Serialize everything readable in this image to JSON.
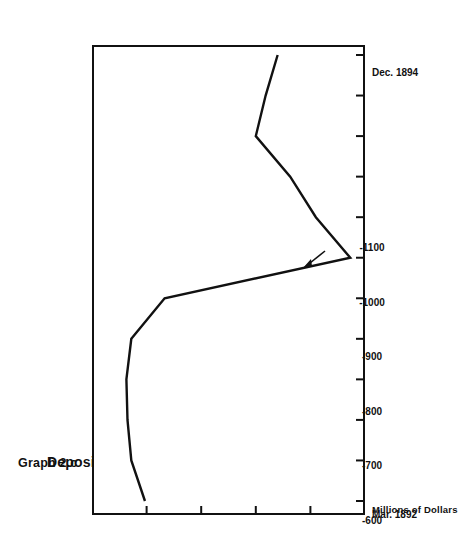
{
  "figure": {
    "graph_label": "Graph 2.c",
    "title": "Deposits Held by Individuals II: 1892-1894",
    "value_axis_title": "Millions of Dollars",
    "orientation": "rotated-90-ccw",
    "ink_color": "#111111",
    "background_color": "#ffffff"
  },
  "annotation": {
    "arrow_name": "peak-arrow",
    "description": "arrow pointing to local maximum"
  },
  "chart_data": {
    "type": "line",
    "title": "Deposits Held by Individuals II: 1892-1894",
    "subtitle": "Graph 2.c",
    "xlabel": "",
    "ylabel": "Millions of Dollars",
    "grid": false,
    "legend": null,
    "x_tick_labels": [
      "Mar. 1892",
      "Dec. 1894"
    ],
    "x_tick_count": 12,
    "y_tick_labels": [
      "-600",
      "-700",
      "-800",
      "-900",
      "-1000",
      "-1100"
    ],
    "y_values_ticks": [
      -600,
      -700,
      -800,
      -900,
      -1000,
      -1100
    ],
    "ylim": [
      -1100,
      -600
    ],
    "xlim": [
      "Mar. 1892",
      "Dec. 1894"
    ],
    "x": [
      "Mar. 1892",
      "Jun. 1892",
      "Sep. 1892",
      "Dec. 1892",
      "Mar. 1893",
      "Jun. 1893",
      "Sep. 1893",
      "Dec. 1893",
      "Mar. 1894",
      "Jun. 1894",
      "Sep. 1894",
      "Dec. 1894"
    ],
    "series": [
      {
        "name": "Deposits Held by Individuals II",
        "values": [
          -697,
          -672,
          -665,
          -663,
          -672,
          -733,
          -1073,
          -1010,
          -963,
          -900,
          -918,
          -940
        ]
      }
    ]
  }
}
